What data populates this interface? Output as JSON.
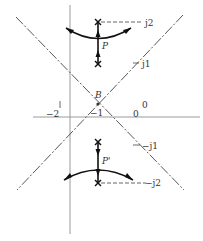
{
  "diagram": {
    "type": "root-locus",
    "labels": {
      "point_b": "B",
      "point_p": "P",
      "point_p_prime": "P'",
      "j2": "j2",
      "j1": "j1",
      "neg_j1": "−j1",
      "neg_j2": "−j2",
      "neg1": "−1",
      "neg2": "−2",
      "one": "1",
      "zero_upper": "0",
      "zero_lower": "0"
    },
    "colors": {
      "axis": "#9a9a9a",
      "asymptote": "#444444",
      "locus": "#111111",
      "dashed": "#555555",
      "background": "#ffffff"
    },
    "elements": {
      "poles": [
        "upper pole at j2",
        "upper pole at j1 (P stem end)",
        "lower pole at -j1",
        "lower pole at -j2"
      ],
      "asymptotes": [
        "dash-dot line through B rising right",
        "dash-dot line through B rising left"
      ],
      "locus_arcs": [
        "upper arc through P with arrows",
        "lower arc through P' with arrows"
      ]
    }
  }
}
